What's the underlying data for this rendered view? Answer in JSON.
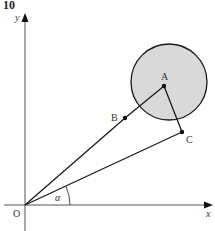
{
  "question_number": "10",
  "colors": {
    "line": "#1a1a1a",
    "circle_fill": "#d9d9d9",
    "axis": "#333333",
    "label": "#333333"
  },
  "axes": {
    "x_label": "x",
    "y_label": "y",
    "origin_label": "O"
  },
  "points": {
    "A": {
      "label": "A",
      "x": 164,
      "y": 86
    },
    "B": {
      "label": "B",
      "x": 125,
      "y": 118
    },
    "C": {
      "label": "C",
      "x": 182,
      "y": 132
    },
    "O": {
      "label": "O",
      "x": 25,
      "y": 205
    }
  },
  "circle": {
    "center_label": "A",
    "cx": 169,
    "cy": 82,
    "r": 38
  },
  "angle": {
    "label": "α",
    "between": [
      "x-axis",
      "OC"
    ]
  }
}
